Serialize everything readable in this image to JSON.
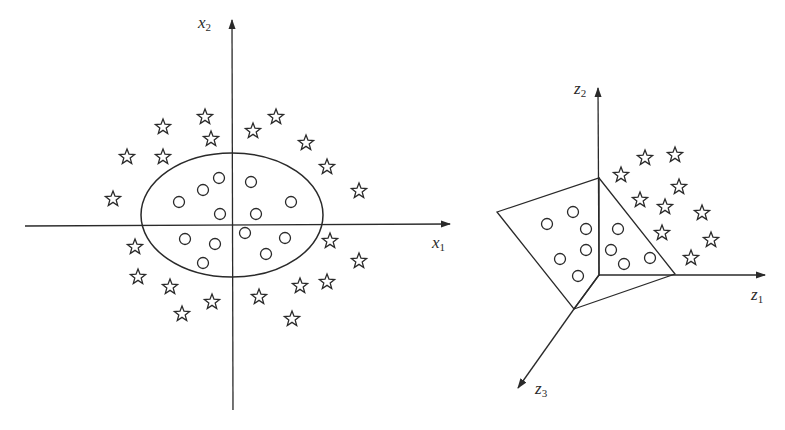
{
  "figure": {
    "left_panel": {
      "axes": {
        "x_label": {
          "var": "x",
          "sub": "1"
        },
        "y_label": {
          "var": "x",
          "sub": "2"
        }
      },
      "ellipse": {
        "cx": 232,
        "cy": 215,
        "rx": 91,
        "ry": 62
      },
      "circles": [
        [
          219,
          178
        ],
        [
          203,
          190
        ],
        [
          179,
          202
        ],
        [
          220,
          214
        ],
        [
          251,
          182
        ],
        [
          291,
          202
        ],
        [
          256,
          214
        ],
        [
          245,
          233
        ],
        [
          285,
          238
        ],
        [
          266,
          254
        ],
        [
          185,
          239
        ],
        [
          215,
          244
        ],
        [
          203,
          263
        ]
      ],
      "stars": [
        [
          205,
          117
        ],
        [
          163,
          127
        ],
        [
          211,
          139
        ],
        [
          127,
          157
        ],
        [
          163,
          157
        ],
        [
          113,
          199
        ],
        [
          276,
          117
        ],
        [
          253,
          131
        ],
        [
          306,
          143
        ],
        [
          327,
          167
        ],
        [
          359,
          191
        ],
        [
          135,
          247
        ],
        [
          138,
          277
        ],
        [
          170,
          287
        ],
        [
          212,
          302
        ],
        [
          182,
          314
        ],
        [
          330,
          241
        ],
        [
          359,
          261
        ],
        [
          300,
          286
        ],
        [
          327,
          282
        ],
        [
          259,
          297
        ],
        [
          292,
          319
        ]
      ]
    },
    "right_panel": {
      "axes": {
        "z1_label": {
          "var": "z",
          "sub": "1"
        },
        "z2_label": {
          "var": "z",
          "sub": "2"
        },
        "z3_label": {
          "var": "z",
          "sub": "3"
        }
      },
      "circles": [
        [
          547,
          224
        ],
        [
          573,
          212
        ],
        [
          586,
          229
        ],
        [
          586,
          250
        ],
        [
          560,
          259
        ],
        [
          578,
          276
        ],
        [
          618,
          229
        ],
        [
          611,
          250
        ],
        [
          624,
          264
        ],
        [
          650,
          258
        ]
      ],
      "stars": [
        [
          645,
          158
        ],
        [
          675,
          155
        ],
        [
          621,
          175
        ],
        [
          679,
          187
        ],
        [
          640,
          200
        ],
        [
          665,
          207
        ],
        [
          702,
          213
        ],
        [
          662,
          233
        ],
        [
          711,
          240
        ],
        [
          691,
          258
        ]
      ]
    },
    "colors": {
      "stroke": "#2a2a2a",
      "background": "#ffffff"
    }
  }
}
